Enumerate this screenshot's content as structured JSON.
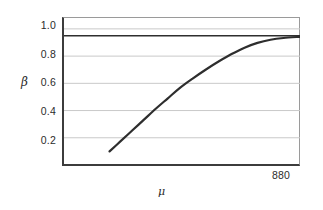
{
  "chart_data": {
    "type": "line",
    "title": "",
    "xlabel": "μ",
    "ylabel": "β",
    "grid": true,
    "legend": false,
    "background": "#ffffff",
    "frame_color": "#9a9a9a",
    "axis_color": "#3c3c3c",
    "gridline_color": "#c9c9c9",
    "curve_color": "#2e2e2e",
    "reference_line_color": "#2e2e2e",
    "ylim": [
      0.0,
      1.08
    ],
    "yticks": [
      1.0,
      0.8,
      0.6,
      0.4,
      0.2
    ],
    "ytick_labels": [
      "1.0",
      "0.8",
      "0.6",
      "0.4",
      "0.2"
    ],
    "xlim": [
      0,
      1.0
    ],
    "xtick_labels": [
      "880"
    ],
    "x_end_label": "880",
    "reference_line": {
      "name": "target-power",
      "orientation": "horizontal",
      "y": 0.95
    },
    "series": [
      {
        "name": "power-curve",
        "x": [
          0.193,
          0.24,
          0.29,
          0.34,
          0.39,
          0.44,
          0.49,
          0.545,
          0.6,
          0.655,
          0.71,
          0.765,
          0.82,
          0.875,
          0.93,
          1.0
        ],
        "y": [
          0.1,
          0.175,
          0.255,
          0.335,
          0.415,
          0.49,
          0.565,
          0.635,
          0.7,
          0.76,
          0.815,
          0.862,
          0.897,
          0.92,
          0.933,
          0.942
        ]
      }
    ]
  },
  "labels": {
    "y_axis": "β",
    "x_axis": "μ",
    "x_end": "880",
    "ytick_0": "1.0",
    "ytick_1": "0.8",
    "ytick_2": "0.6",
    "ytick_3": "0.4",
    "ytick_4": "0.2"
  }
}
